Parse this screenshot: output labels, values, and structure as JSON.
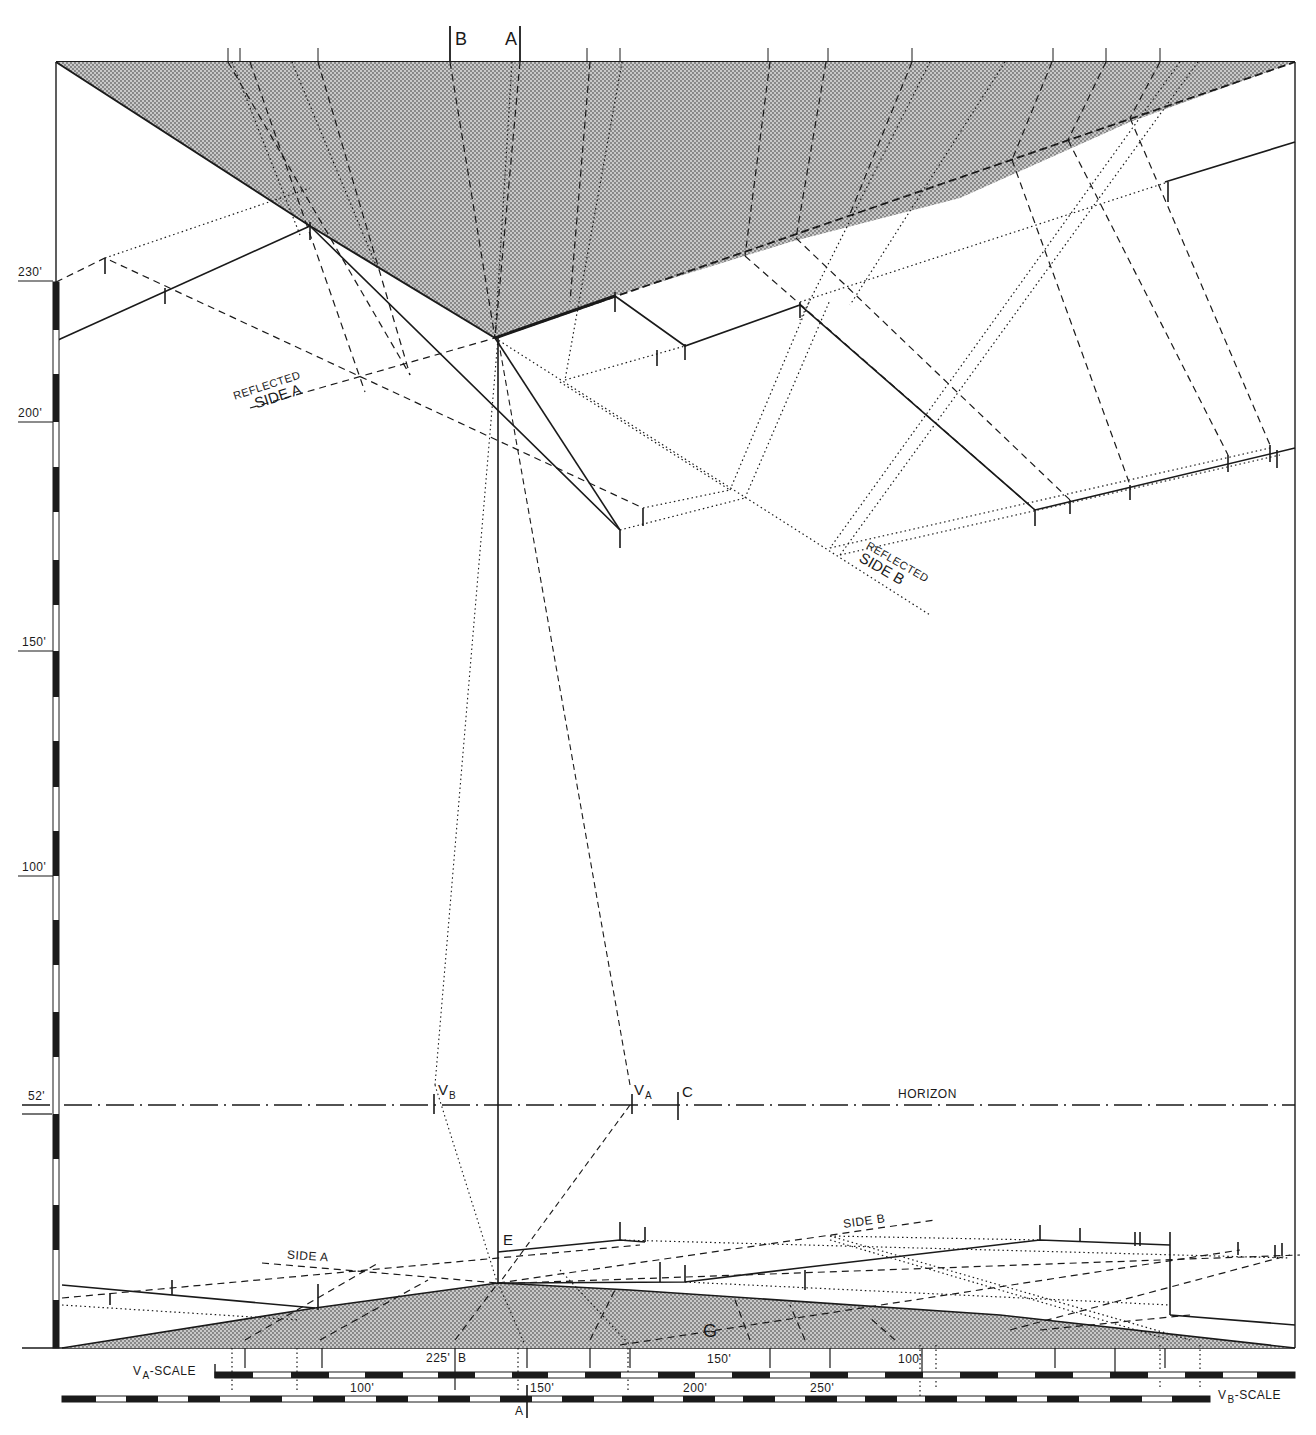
{
  "figure": {
    "title": "",
    "type": "perspective reflection construction drawing",
    "colors": {
      "ink": "#1a1a1a",
      "shade": "#b8b8b8",
      "paper": "#ffffff"
    }
  },
  "top_markers": {
    "b": "B",
    "a": "A"
  },
  "left_scale": {
    "ticks": [
      {
        "label": "230'",
        "y": 281
      },
      {
        "label": "200'",
        "y": 422
      },
      {
        "label": "150'",
        "y": 651
      },
      {
        "label": "100'",
        "y": 875
      },
      {
        "label": "52'",
        "y": 1104
      }
    ]
  },
  "reflected_labels": {
    "side_a_line1": "REFLECTED",
    "side_a_line2": "SIDE A",
    "side_b_line1": "REFLECTED",
    "side_b_line2": "SIDE B"
  },
  "horizon": {
    "label": "HORIZON",
    "vb": "V",
    "vb_sub": "B",
    "va": "V",
    "va_sub": "A",
    "c": "C"
  },
  "ground_labels": {
    "side_a": "SIDE A",
    "side_b": "SIDE B",
    "e": "E",
    "g": "G"
  },
  "bottom_scales": {
    "va_scale": {
      "label_main": "V",
      "label_sub": "A",
      "label_suffix": "-SCALE",
      "ticks": [
        "225'",
        "150'",
        "100'"
      ],
      "marker_b": "B"
    },
    "vb_scale": {
      "label_main": "V",
      "label_sub": "B",
      "label_suffix": "-SCALE",
      "ticks": [
        "100'",
        "150'",
        "200'",
        "250'"
      ],
      "marker_a": "A"
    }
  }
}
